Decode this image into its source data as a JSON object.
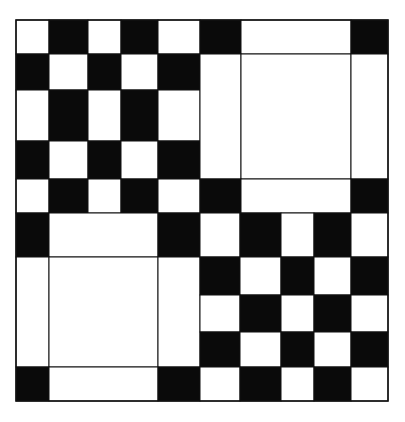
{
  "colors": {
    "dark": "#0a0a0a",
    "light": "#ffffff",
    "line": "#111111",
    "background": "#ffffff"
  },
  "outer": {
    "x": 16,
    "y": 20,
    "w": 372,
    "h": 381
  },
  "blocks": [
    {
      "name": "checkerboard-top-left",
      "type": "checkerboard",
      "cols": [
        16,
        49,
        88,
        121,
        158,
        200
      ],
      "rows": [
        20,
        54,
        90,
        141,
        179,
        213
      ],
      "first": "light"
    },
    {
      "name": "frame-top-right",
      "type": "frame",
      "cols": [
        200,
        241,
        351,
        388
      ],
      "rows": [
        20,
        54,
        179,
        213
      ]
    },
    {
      "name": "frame-bottom-left",
      "type": "frame",
      "cols": [
        16,
        49,
        158,
        200
      ],
      "rows": [
        213,
        257,
        367,
        401
      ]
    },
    {
      "name": "checkerboard-bottom-right",
      "type": "checkerboard",
      "cols": [
        200,
        240,
        281,
        314,
        351,
        388
      ],
      "rows": [
        213,
        257,
        295,
        332,
        367,
        401
      ],
      "first": "light"
    }
  ]
}
